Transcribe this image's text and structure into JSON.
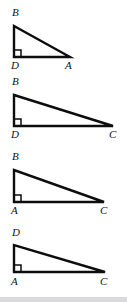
{
  "figure": {
    "background_color": "#ffffff",
    "line_color": "#0d0d0d",
    "label_color": "#111111",
    "bottom_strip_color": "#d9d9dd",
    "triangles": [
      {
        "id": "triangle-1",
        "vertices": {
          "top_left": "B",
          "bottom_left": "D",
          "bottom_right": "A"
        },
        "right_angle_at": "D",
        "legs": {
          "vertical_px": 31,
          "horizontal_px": 54
        }
      },
      {
        "id": "triangle-2",
        "vertices": {
          "top_left": "B",
          "bottom_left": "D",
          "bottom_right": "C"
        },
        "right_angle_at": "D",
        "legs": {
          "vertical_px": 31,
          "horizontal_px": 98
        }
      },
      {
        "id": "triangle-3",
        "vertices": {
          "top_left": "B",
          "bottom_left": "A",
          "bottom_right": "C"
        },
        "right_angle_at": "A",
        "legs": {
          "vertical_px": 32,
          "horizontal_px": 89
        }
      },
      {
        "id": "triangle-4",
        "vertices": {
          "top_left": "D",
          "bottom_left": "A",
          "bottom_right": "C"
        },
        "right_angle_at": "A",
        "legs": {
          "vertical_px": 27,
          "horizontal_px": 90
        }
      }
    ],
    "labels": {
      "t1_apex": "B",
      "t1_bottom_left": "D",
      "t1_bottom_right": "A",
      "t2_apex": "B",
      "t2_bottom_left": "D",
      "t2_bottom_right": "C",
      "t3_apex": "B",
      "t3_bottom_left": "A",
      "t3_bottom_right": "C",
      "t4_apex": "D",
      "t4_bottom_left": "A",
      "t4_bottom_right": "C"
    }
  }
}
